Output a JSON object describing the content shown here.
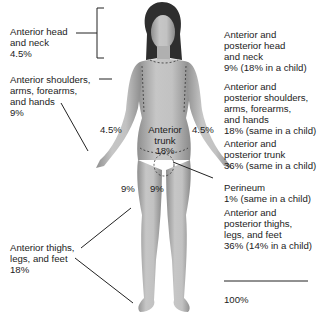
{
  "diagram": {
    "type": "rule-of-nines-body-map",
    "left_labels": [
      {
        "id": "head",
        "lines": [
          "Anterior head",
          "and neck",
          "4.5%"
        ]
      },
      {
        "id": "arms",
        "lines": [
          "Anterior shoulders,",
          "arms, forearms,",
          "and hands",
          "9%"
        ]
      },
      {
        "id": "legs",
        "lines": [
          "Anterior thighs,",
          "legs, and feet",
          "18%"
        ]
      }
    ],
    "right_labels": [
      {
        "id": "head",
        "lines": [
          "Anterior and",
          "posterior head",
          "and neck",
          "9% (18% in a child)"
        ]
      },
      {
        "id": "arms",
        "lines": [
          "Anterior and",
          "posterior shoulders,",
          "arms, forearms,",
          "and hands",
          "18% (same in a child)"
        ]
      },
      {
        "id": "trunk",
        "lines": [
          "Anterior and",
          "posterior trunk",
          "36% (same in a child)"
        ]
      },
      {
        "id": "perineum",
        "lines": [
          "Perineum",
          "1% (same in a child)"
        ]
      },
      {
        "id": "legs",
        "lines": [
          "Anterior and",
          "posterior thighs,",
          "legs, and feet",
          "36% (14% in a child)"
        ]
      }
    ],
    "total": "100%",
    "figure_labels": {
      "left_arm": "4.5%",
      "right_arm": "4.5%",
      "trunk_lines": [
        "Anterior",
        "trunk",
        "18%"
      ],
      "left_thigh": "9%",
      "right_thigh": "9%"
    },
    "colors": {
      "skin": "#b9b9b9",
      "skin_dark": "#8d8d8d",
      "hair": "#2b2b2b",
      "line": "#222222"
    }
  }
}
